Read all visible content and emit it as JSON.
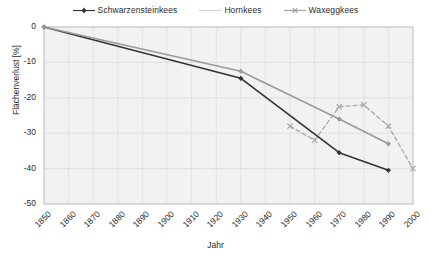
{
  "chart_data": {
    "type": "line",
    "title": "",
    "xlabel": "Jahr",
    "ylabel": "Flächenverlust [%]",
    "xlim": [
      1850,
      2000
    ],
    "ylim": [
      -50,
      0
    ],
    "xticks": [
      1850,
      1860,
      1870,
      1880,
      1890,
      1900,
      1910,
      1920,
      1930,
      1940,
      1950,
      1960,
      1970,
      1980,
      1990,
      2000
    ],
    "yticks": [
      0,
      -10,
      -20,
      -30,
      -40,
      -50
    ],
    "grid": true,
    "legend_position": "top-center",
    "series": [
      {
        "name": "Schwarzensteinkees",
        "color": "#333333",
        "style": "solid",
        "marker": "diamond",
        "x": [
          1850,
          1930,
          1970,
          1990
        ],
        "values": [
          0,
          -14.5,
          -35.5,
          -40.5
        ]
      },
      {
        "name": "Hornkees",
        "color": "#9a9a9a",
        "style": "solid",
        "marker": "diamond",
        "x": [
          1850,
          1930,
          1970,
          1990
        ],
        "values": [
          0,
          -12.5,
          -26,
          -33
        ]
      },
      {
        "name": "Waxeggkees",
        "color": "#a8a8a8",
        "style": "dashed",
        "marker": "x",
        "x": [
          1950,
          1960,
          1970,
          1980,
          1990,
          2000
        ],
        "values": [
          -28,
          -32,
          -22.5,
          -22,
          -28,
          -40
        ]
      }
    ]
  },
  "legend": {
    "items": [
      {
        "label": "Schwarzensteinkees"
      },
      {
        "label": "Hornkees"
      },
      {
        "label": "Waxeggkees"
      }
    ]
  },
  "axes": {
    "x_title": "Jahr",
    "y_title": "Flächenverlust [%]"
  },
  "colors": {
    "series_dark": "#333333",
    "series_mid": "#9a9a9a",
    "series_light": "#a8a8a8",
    "plot_bg": "#f2f2f2",
    "grid": "#d8d8d8",
    "text": "#2b2b2b"
  }
}
